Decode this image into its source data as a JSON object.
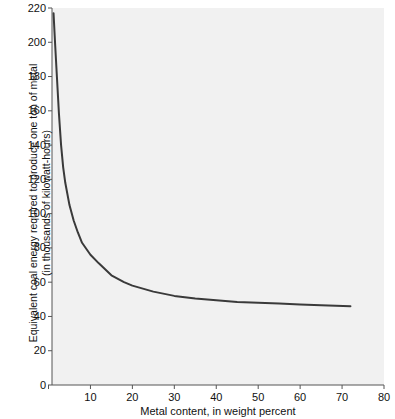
{
  "chart_data": {
    "type": "line",
    "title": "",
    "xlabel": "Metal content, in weight percent",
    "ylabel_line1": "Equivalent coal energy required to produce one ton of metal",
    "ylabel_line2": "(in thousands of kilowatt-hours)",
    "xlim": [
      0,
      80
    ],
    "ylim": [
      0,
      220
    ],
    "xticks": [
      0,
      10,
      20,
      30,
      40,
      50,
      60,
      70,
      80
    ],
    "xtick_labels": [
      "0",
      "10",
      "20",
      "30",
      "40",
      "50",
      "60",
      "70",
      "80"
    ],
    "yticks": [
      0,
      20,
      40,
      60,
      80,
      100,
      120,
      140,
      160,
      180,
      200,
      220
    ],
    "ytick_labels": [
      "0",
      "20",
      "40",
      "60",
      "80",
      "100",
      "120",
      "140",
      "160",
      "180",
      "200",
      "220"
    ],
    "grid": false,
    "legend": false,
    "series": [
      {
        "name": "Equivalent coal energy",
        "color": "#3a3a3a",
        "line_width": 2,
        "x": [
          1.2,
          1.6,
          2.0,
          2.5,
          3.0,
          3.5,
          4.0,
          5.0,
          6.0,
          7.0,
          8.0,
          10.0,
          12.0,
          15.0,
          18.0,
          20.0,
          25.0,
          30.0,
          35.0,
          40.0,
          45.0,
          50.0,
          55.0,
          60.0,
          65.0,
          72.0
        ],
        "y": [
          217.0,
          198.0,
          180.0,
          158.0,
          140.0,
          127.0,
          118.0,
          105.0,
          96.0,
          89.0,
          83.0,
          76.0,
          71.0,
          64.0,
          60.0,
          58.0,
          54.5,
          52.0,
          50.5,
          49.5,
          48.5,
          48.0,
          47.5,
          47.0,
          46.5,
          46.0
        ]
      }
    ]
  },
  "axes": {
    "plot_left_px": 52,
    "plot_right_px": 384,
    "plot_top_px": 8,
    "plot_bottom_px": 385,
    "background_color": "#f1f1f1",
    "axis_color": "#555555"
  }
}
